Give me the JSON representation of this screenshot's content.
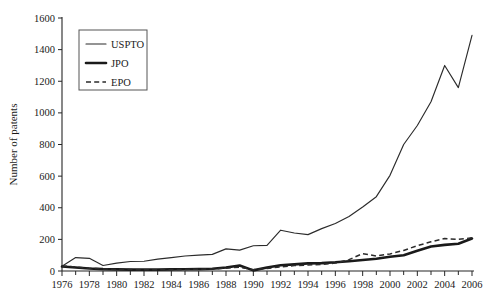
{
  "chart_data": {
    "type": "line",
    "title": "",
    "xlabel": "",
    "ylabel": "Number of patents",
    "xlim": [
      1976,
      2006
    ],
    "ylim": [
      0,
      1600
    ],
    "grid": false,
    "legend_position": "top-left",
    "x": [
      1976,
      1977,
      1978,
      1979,
      1980,
      1981,
      1982,
      1983,
      1984,
      1985,
      1986,
      1987,
      1988,
      1989,
      1990,
      1991,
      1992,
      1993,
      1994,
      1995,
      1996,
      1997,
      1998,
      1999,
      2000,
      2001,
      2002,
      2003,
      2004,
      2005,
      2006
    ],
    "xtick_labels": [
      "1976",
      "1978",
      "1980",
      "1982",
      "1984",
      "1986",
      "1988",
      "1990",
      "1992",
      "1994",
      "1996",
      "1998",
      "2000",
      "2002",
      "2004",
      "2006"
    ],
    "xtick_values": [
      1976,
      1978,
      1980,
      1982,
      1984,
      1986,
      1988,
      1990,
      1992,
      1994,
      1996,
      1998,
      2000,
      2002,
      2004,
      2006
    ],
    "ytick_labels": [
      "0",
      "200",
      "400",
      "600",
      "800",
      "1000",
      "1200",
      "1400",
      "1600"
    ],
    "ytick_values": [
      0,
      200,
      400,
      600,
      800,
      1000,
      1200,
      1400,
      1600
    ],
    "series": [
      {
        "name": "USPTO",
        "style": "thin-solid",
        "color": "#2b2b2b",
        "values": [
          30,
          85,
          80,
          35,
          50,
          60,
          62,
          75,
          85,
          95,
          100,
          105,
          140,
          132,
          160,
          162,
          258,
          240,
          230,
          268,
          300,
          345,
          405,
          470,
          605,
          800,
          920,
          1070,
          1300,
          1160,
          1490
        ]
      },
      {
        "name": "JPO",
        "style": "thick-solid",
        "color": "#1a1a1a",
        "values": [
          28,
          22,
          16,
          12,
          10,
          9,
          9,
          9,
          10,
          11,
          12,
          14,
          22,
          35,
          4,
          22,
          36,
          42,
          48,
          50,
          55,
          62,
          70,
          78,
          90,
          100,
          128,
          155,
          165,
          172,
          205
        ]
      },
      {
        "name": "EPO",
        "style": "dashed",
        "color": "#2b2b2b",
        "values": [
          32,
          25,
          18,
          13,
          10,
          9,
          8,
          8,
          9,
          10,
          11,
          13,
          18,
          24,
          8,
          16,
          26,
          34,
          38,
          42,
          50,
          72,
          110,
          95,
          108,
          130,
          160,
          185,
          205,
          200,
          210
        ]
      }
    ]
  },
  "legend": {
    "items": [
      {
        "label": "USPTO",
        "style": "thin-solid"
      },
      {
        "label": "JPO",
        "style": "thick-solid"
      },
      {
        "label": "EPO",
        "style": "dashed"
      }
    ]
  },
  "axes": {
    "y_title": "Number of patents"
  }
}
